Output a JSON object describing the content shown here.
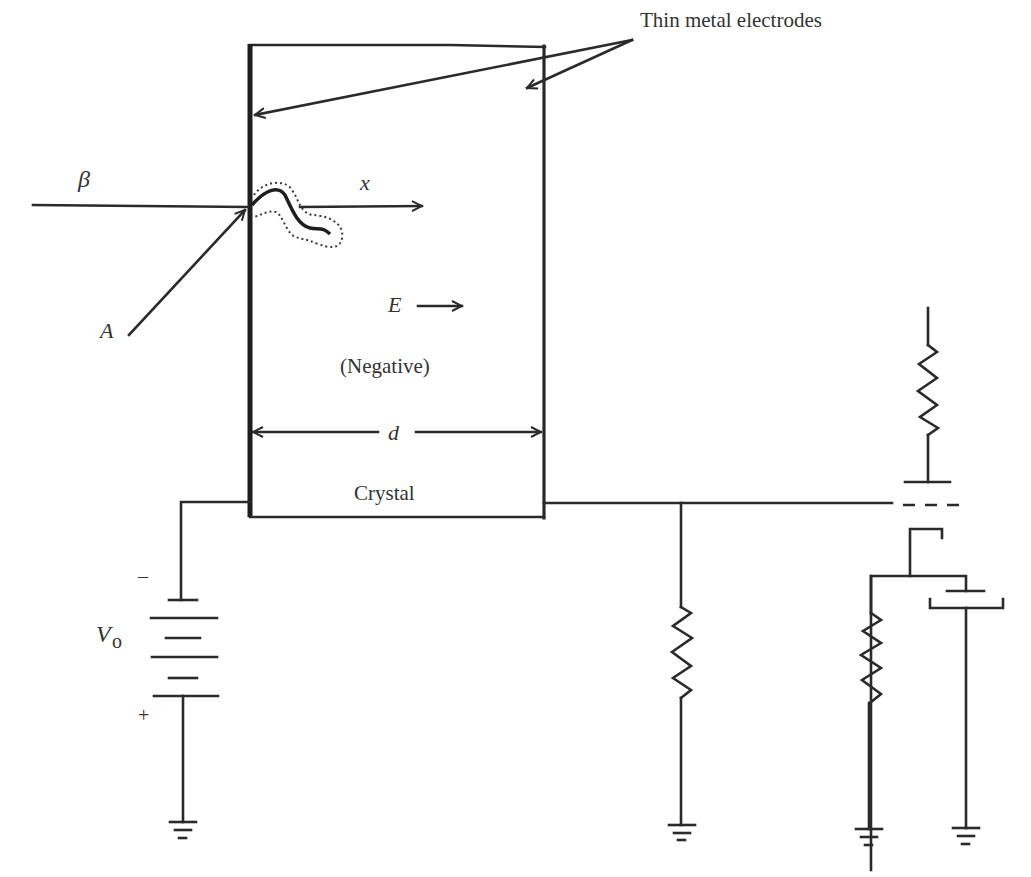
{
  "diagram": {
    "type": "circuit-schematic",
    "labels": {
      "electrodes": "Thin metal electrodes",
      "beta": "β",
      "x_axis": "x",
      "alpha": "A",
      "field": "E",
      "polarity": "(Negative)",
      "distance": "d",
      "crystal": "Crystal",
      "battery_voltage": "V",
      "battery_subscript": "o",
      "minus": "–",
      "plus": "+"
    },
    "components": [
      {
        "id": "crystal",
        "kind": "rectangle",
        "label": "Crystal"
      },
      {
        "id": "battery",
        "kind": "battery",
        "label": "Vo",
        "cells": 3
      },
      {
        "id": "load-resistor",
        "kind": "resistor"
      },
      {
        "id": "grid-resistor",
        "kind": "resistor"
      },
      {
        "id": "plate-resistor",
        "kind": "resistor"
      },
      {
        "id": "vacuum-tube",
        "kind": "triode"
      },
      {
        "id": "ground",
        "kind": "ground",
        "count": 4
      }
    ],
    "colors": {
      "line": "#2a2a2a",
      "text": "#333333",
      "background": "#ffffff"
    }
  }
}
